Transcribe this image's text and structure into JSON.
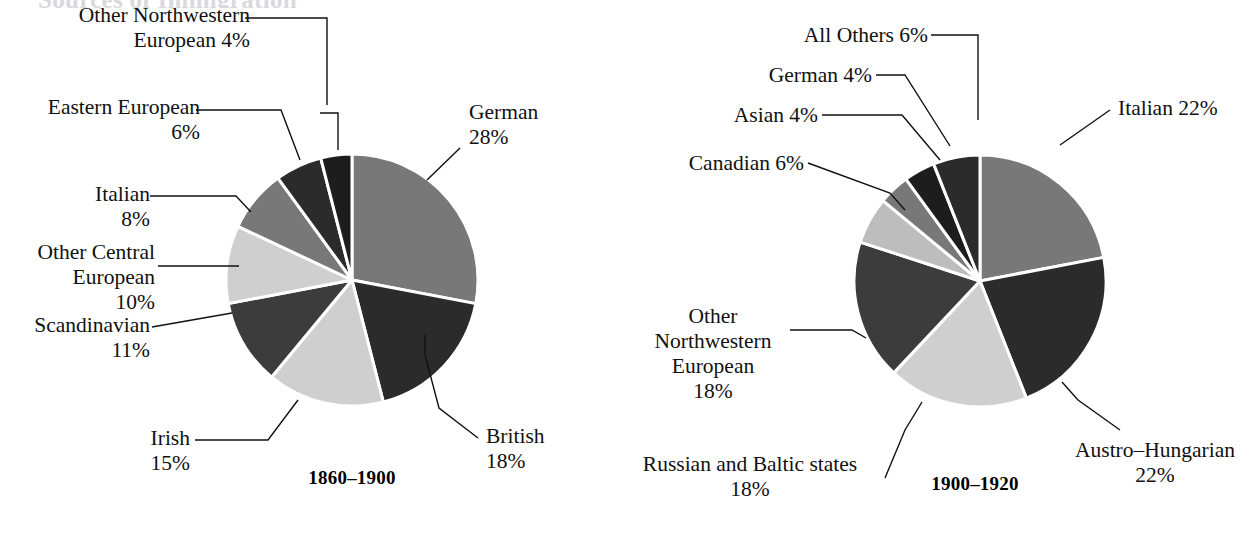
{
  "page": {
    "cropped_heading": "Sources of Immigration",
    "background": "#ffffff",
    "text_color": "#111111"
  },
  "palette": {
    "medium_gray": "#787878",
    "dark": "#2b2b2b",
    "light_gray": "#cfcfcf",
    "dark_gray": "#3c3c3c",
    "pale_gray": "#bdbdbd",
    "near_black": "#1d1d1d",
    "divider": "#ffffff"
  },
  "chart_data": [
    {
      "type": "pie",
      "title": "1860–1900",
      "caption": "1860–1900",
      "center": [
        352,
        280
      ],
      "radius": 126,
      "start_angle": 0,
      "direction": "clockwise",
      "categories": [
        "German",
        "British",
        "Irish",
        "Scandinavian",
        "Other Central European",
        "Italian",
        "Eastern European",
        "Other Northwestern European"
      ],
      "values": [
        28,
        18,
        15,
        11,
        10,
        8,
        6,
        4
      ],
      "slices": [
        {
          "name": "German",
          "value": 28,
          "label": "German\n28%",
          "color": "#787878"
        },
        {
          "name": "British",
          "value": 18,
          "label": "British\n18%",
          "color": "#2b2b2b"
        },
        {
          "name": "Irish",
          "value": 15,
          "label": "Irish\n15%",
          "color": "#cfcfcf"
        },
        {
          "name": "Scandinavian",
          "value": 11,
          "label": "Scandinavian\n11%",
          "color": "#3c3c3c"
        },
        {
          "name": "Other Central European",
          "value": 10,
          "label": "Other Central\nEuropean\n10%",
          "color": "#cfcfcf"
        },
        {
          "name": "Italian",
          "value": 8,
          "label": "Italian\n8%",
          "color": "#787878"
        },
        {
          "name": "Eastern European",
          "value": 6,
          "label": "Eastern European\n6%",
          "color": "#2b2b2b"
        },
        {
          "name": "Other Northwestern European",
          "value": 4,
          "label": "Other Northwestern\nEuropean 4%",
          "color": "#1d1d1d"
        }
      ],
      "labels": {
        "other_northwestern_european": "Other Northwestern\nEuropean 4%",
        "eastern_european": "Eastern European\n6%",
        "italian": "Italian\n8%",
        "other_central_european": "Other Central\nEuropean\n10%",
        "scandinavian": "Scandinavian\n11%",
        "irish": "Irish\n15%",
        "british": "British\n18%",
        "german": "German\n28%"
      }
    },
    {
      "type": "pie",
      "title": "1900–1920",
      "caption": "1900–1920",
      "center": [
        980,
        281
      ],
      "radius": 126,
      "start_angle": 0,
      "direction": "clockwise",
      "categories": [
        "Italian",
        "Austro-Hungarian",
        "Russian and Baltic states",
        "Other Northwestern European",
        "Canadian",
        "Asian",
        "German",
        "All Others"
      ],
      "values": [
        22,
        22,
        18,
        18,
        6,
        4,
        4,
        6
      ],
      "slices": [
        {
          "name": "Italian",
          "value": 22,
          "label": "Italian 22%",
          "color": "#787878"
        },
        {
          "name": "Austro-Hungarian",
          "value": 22,
          "label": "Austro–Hungarian\n22%",
          "color": "#2b2b2b"
        },
        {
          "name": "Russian and Baltic states",
          "value": 18,
          "label": "Russian and Baltic states\n18%",
          "color": "#cfcfcf"
        },
        {
          "name": "Other Northwestern European",
          "value": 18,
          "label": "Other\nNorthwestern\nEuropean\n18%",
          "color": "#3c3c3c"
        },
        {
          "name": "Canadian",
          "value": 6,
          "label": "Canadian 6%",
          "color": "#bdbdbd"
        },
        {
          "name": "Asian",
          "value": 4,
          "label": "Asian 4%",
          "color": "#787878"
        },
        {
          "name": "German",
          "value": 4,
          "label": "German 4%",
          "color": "#1d1d1d"
        },
        {
          "name": "All Others",
          "value": 6,
          "label": "All Others 6%",
          "color": "#2b2b2b"
        }
      ],
      "labels": {
        "all_others": "All Others 6%",
        "german": "German 4%",
        "asian": "Asian 4%",
        "canadian": "Canadian 6%",
        "italian": "Italian 22%",
        "austro_hungarian": "Austro–Hungarian\n22%",
        "russian_and_baltic": "Russian and Baltic states\n18%",
        "other_northwestern_european": "Other\nNorthwestern\nEuropean\n18%"
      }
    }
  ]
}
